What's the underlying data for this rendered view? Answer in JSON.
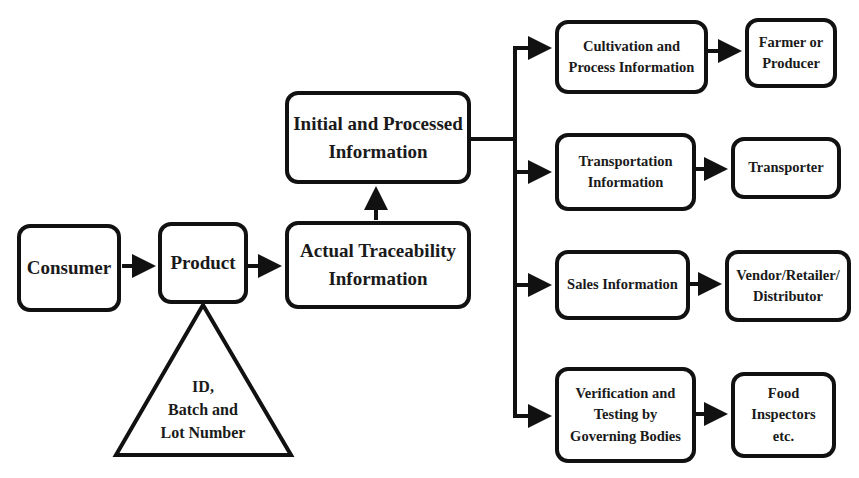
{
  "diagram": {
    "nodes": {
      "consumer": "Consumer",
      "product": "Product",
      "id_batch": "ID,\nBatch and\nLot Number",
      "actual_traceability": "Actual Traceability\nInformation",
      "initial_processed": "Initial and Processed\nInformation",
      "cultivation": "Cultivation and\nProcess Information",
      "transportation": "Transportation\nInformation",
      "sales": "Sales Information",
      "verification": "Verification and\nTesting by\nGoverning Bodies",
      "farmer": "Farmer or\nProducer",
      "transporter": "Transporter",
      "vendor": "Vendor/Retailer/\nDistributor",
      "inspectors": "Food\nInspectors\netc."
    },
    "edges": [
      {
        "from": "consumer",
        "to": "product"
      },
      {
        "from": "product",
        "to": "actual_traceability"
      },
      {
        "from": "product",
        "to": "id_batch",
        "type": "attribute"
      },
      {
        "from": "actual_traceability",
        "to": "initial_processed"
      },
      {
        "from": "initial_processed",
        "to": "cultivation"
      },
      {
        "from": "initial_processed",
        "to": "transportation"
      },
      {
        "from": "initial_processed",
        "to": "sales"
      },
      {
        "from": "initial_processed",
        "to": "verification"
      },
      {
        "from": "cultivation",
        "to": "farmer"
      },
      {
        "from": "transportation",
        "to": "transporter"
      },
      {
        "from": "sales",
        "to": "vendor"
      },
      {
        "from": "verification",
        "to": "inspectors"
      }
    ],
    "line_color": "#111111"
  }
}
